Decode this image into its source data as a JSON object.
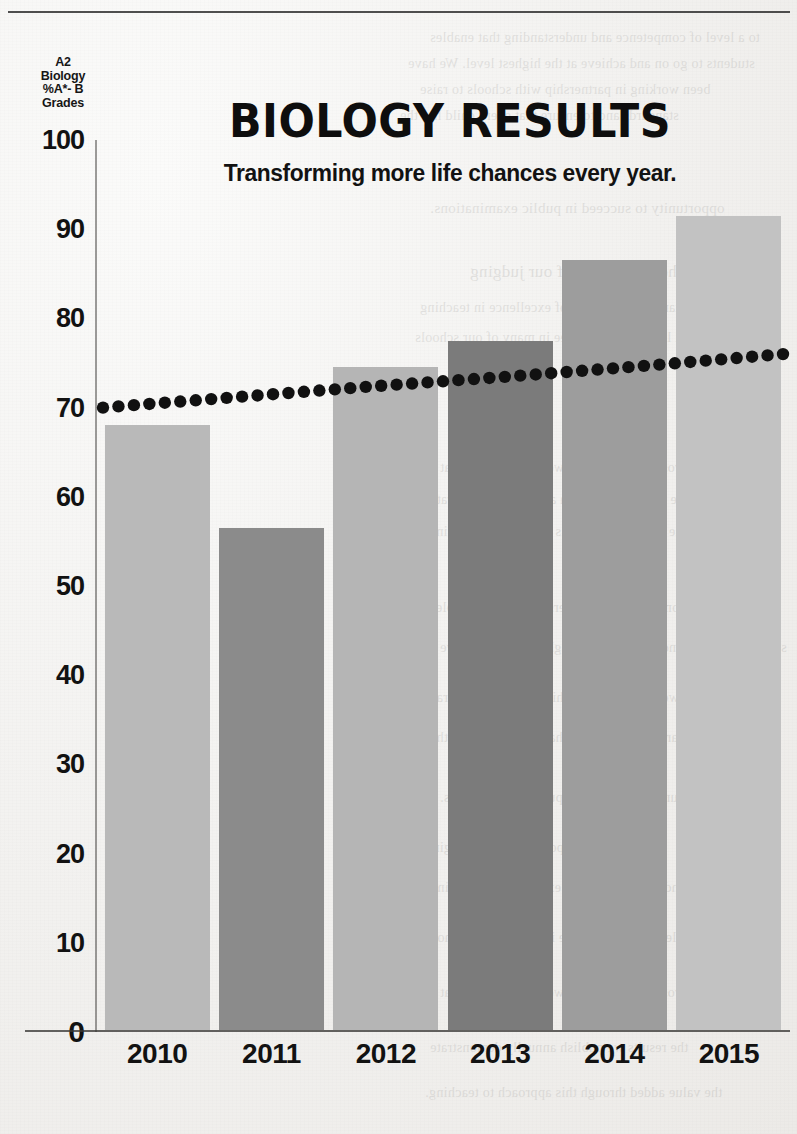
{
  "chart_data": {
    "type": "bar",
    "title": "BIOLOGY RESULTS",
    "subtitle": "Transforming more life chances every year.",
    "xlabel": "",
    "ylabel": "A2 Biology %A*- B Grades",
    "ylabel_lines": [
      "A2",
      "Biology",
      "%A*- B",
      "Grades"
    ],
    "categories": [
      "2010",
      "2011",
      "2012",
      "2013",
      "2014",
      "2015"
    ],
    "values": [
      68,
      56.5,
      74.5,
      77.5,
      86.5,
      91.5
    ],
    "bar_colors": [
      "#b9b9b9",
      "#8b8b8b",
      "#b5b5b5",
      "#7b7b7b",
      "#9d9d9d",
      "#c2c2c2"
    ],
    "ylim": [
      0,
      100
    ],
    "yticks": [
      0,
      10,
      20,
      30,
      40,
      50,
      60,
      70,
      80,
      90,
      100
    ],
    "ytick_labels": [
      "0",
      "10",
      "20",
      "30",
      "40",
      "50",
      "60",
      "70",
      "80",
      "90",
      "100"
    ],
    "grid": false,
    "legend": "none",
    "series": [
      {
        "name": "A2 Biology %A*- B Grades",
        "type": "bar",
        "values": [
          68,
          56.5,
          74.5,
          77.5,
          86.5,
          91.5
        ]
      },
      {
        "name": "Trend line",
        "type": "line",
        "style": "dotted",
        "color": "#111111",
        "values": [
          70,
          71.2,
          72.4,
          73.5,
          74.7,
          76
        ]
      }
    ]
  },
  "bleed_text": {
    "lines": [
      "to a level of competence and understanding that enables",
      "students to go on and achieve at the highest level. We have",
      "been working in partnership with schools to raise",
      "standards and to ensure that every child has the",
      "opportunity to succeed in public examinations.",
      "The importance of our judging",
      "standards of a level of excellence in teaching",
      "and learning that we see in many of our schools",
      "across the region and we are confident that",
      "the results we publish annually demonstrate",
      "the value added through this approach to teaching."
    ]
  },
  "colors": {
    "ink": "#121212",
    "axis": "#3a3836",
    "paper": "#f2f1ef",
    "trend": "#111111"
  }
}
